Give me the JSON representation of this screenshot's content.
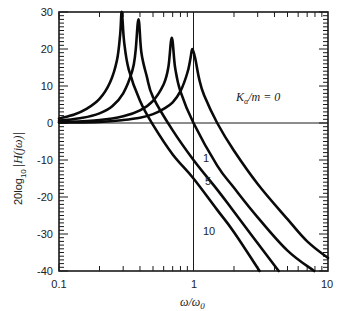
{
  "chart_data": {
    "type": "line",
    "title": "",
    "xlabel": "ω/ω0",
    "ylabel": "20log10|H(jω)|",
    "xscale": "log",
    "xlim": [
      0.1,
      10
    ],
    "ylim": [
      -40,
      30
    ],
    "x_ticks": [
      0.1,
      1,
      10
    ],
    "x_tick_labels": [
      "0.1",
      "1",
      "10"
    ],
    "y_ticks": [
      -40,
      -30,
      -20,
      -10,
      0,
      10,
      20,
      30
    ],
    "y_tick_labels": [
      "-40",
      "-30",
      "-20",
      "-10",
      "0",
      "10",
      "20",
      "30"
    ],
    "reference_lines": {
      "vertical_x": 1,
      "horizontal_y": 0
    },
    "legend_title": "K_a/m",
    "series": [
      {
        "name": "K_a/m = 0",
        "label": "Kα/m = 0",
        "peak": [
          1.0,
          20
        ],
        "points": [
          [
            0.1,
            0.1
          ],
          [
            0.2,
            0.3
          ],
          [
            0.3,
            0.8
          ],
          [
            0.4,
            1.4
          ],
          [
            0.5,
            2.4
          ],
          [
            0.6,
            3.8
          ],
          [
            0.7,
            5.6
          ],
          [
            0.8,
            8.6
          ],
          [
            0.9,
            13.5
          ],
          [
            0.95,
            17.5
          ],
          [
            0.98,
            20
          ],
          [
            1.03,
            17.5
          ],
          [
            1.1,
            12
          ],
          [
            1.2,
            7.5
          ],
          [
            1.5,
            0
          ],
          [
            2,
            -7.5
          ],
          [
            3,
            -16.5
          ],
          [
            5,
            -26
          ],
          [
            7,
            -32
          ],
          [
            10,
            -36.5
          ]
        ]
      },
      {
        "name": "K_a/m = 1",
        "label": "1",
        "peak": [
          0.69,
          23
        ],
        "points": [
          [
            0.1,
            0.2
          ],
          [
            0.2,
            0.8
          ],
          [
            0.3,
            1.8
          ],
          [
            0.4,
            3.4
          ],
          [
            0.5,
            6
          ],
          [
            0.6,
            10.5
          ],
          [
            0.65,
            15
          ],
          [
            0.69,
            23
          ],
          [
            0.73,
            15
          ],
          [
            0.8,
            8.5
          ],
          [
            1,
            0
          ],
          [
            1.5,
            -11.5
          ],
          [
            2,
            -17.5
          ],
          [
            3,
            -25.5
          ],
          [
            5,
            -34.5
          ],
          [
            7.9,
            -40
          ]
        ]
      },
      {
        "name": "K_a/m = 5",
        "label": "5",
        "peak": [
          0.39,
          28
        ],
        "points": [
          [
            0.1,
            0.6
          ],
          [
            0.15,
            1.4
          ],
          [
            0.2,
            2.6
          ],
          [
            0.25,
            4.6
          ],
          [
            0.3,
            8
          ],
          [
            0.35,
            14
          ],
          [
            0.37,
            19
          ],
          [
            0.39,
            28
          ],
          [
            0.41,
            19
          ],
          [
            0.45,
            12.5
          ],
          [
            0.5,
            7
          ],
          [
            0.7,
            -2
          ],
          [
            1,
            -10
          ],
          [
            1.5,
            -18
          ],
          [
            2,
            -24
          ],
          [
            3,
            -32.5
          ],
          [
            4.3,
            -40
          ]
        ]
      },
      {
        "name": "K_a/m = 10",
        "label": "10",
        "peak": [
          0.29,
          30
        ],
        "points": [
          [
            0.1,
            1.2
          ],
          [
            0.13,
            2.3
          ],
          [
            0.16,
            3.8
          ],
          [
            0.2,
            6.5
          ],
          [
            0.24,
            11
          ],
          [
            0.27,
            17
          ],
          [
            0.285,
            24
          ],
          [
            0.293,
            30
          ],
          [
            0.305,
            22
          ],
          [
            0.33,
            14.5
          ],
          [
            0.4,
            6
          ],
          [
            0.5,
            -0.5
          ],
          [
            0.7,
            -8.5
          ],
          [
            1,
            -15
          ],
          [
            1.5,
            -23.5
          ],
          [
            2,
            -29.5
          ],
          [
            3.1,
            -40
          ]
        ]
      }
    ],
    "annotations": [
      {
        "text_italic": "Kα/m = 0",
        "x": 1.4,
        "y": 8
      },
      {
        "text": "1",
        "x": 1.1,
        "y": -9
      },
      {
        "text": "5",
        "x": 1.12,
        "y": -15
      },
      {
        "text": "10",
        "x": 1.12,
        "y": -29
      }
    ]
  },
  "labels": {
    "y_axis": "20log",
    "y_axis_sub": "10",
    "y_axis_func": "|H(jω)|",
    "x_axis_omega": "ω/ω",
    "x_axis_sub": "0",
    "k_label_K": "K",
    "k_label_sub": "α",
    "k_label_rest": "/m = 0",
    "curve_1": "1",
    "curve_5": "5",
    "curve_10": "10",
    "xtick_01": "0.1",
    "xtick_1": "1",
    "xtick_10": "10",
    "ytick_30": "30",
    "ytick_20": "20",
    "ytick_10": "10",
    "ytick_0": "0",
    "ytick_m10": "-10",
    "ytick_m20": "-20",
    "ytick_m30": "-30",
    "ytick_m40": "-40"
  },
  "colors": {
    "curve": "#0a0a0a",
    "axis": "#1a1a1a",
    "background": "#ffffff"
  }
}
